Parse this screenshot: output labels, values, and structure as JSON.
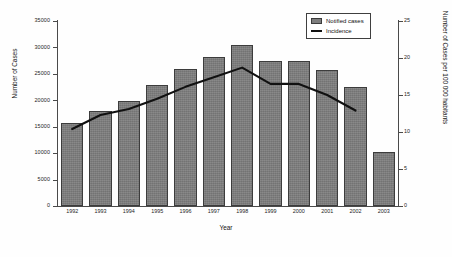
{
  "chart_data": {
    "type": "bar",
    "title": "",
    "xlabel": "Year",
    "ylabel": "Number of Cases",
    "y2label": "Number of Cases per 100 000 habitants",
    "categories": [
      "1992",
      "1993",
      "1994",
      "1995",
      "1996",
      "1997",
      "1998",
      "1999",
      "2000",
      "2001",
      "2002",
      "2003"
    ],
    "ylim": [
      0,
      35000
    ],
    "y2lim": [
      0,
      25
    ],
    "yticks": [
      "0",
      "5000",
      "10000",
      "15000",
      "20000",
      "25000",
      "30000",
      "35000"
    ],
    "y2ticks": [
      "0",
      "5",
      "10",
      "15",
      "20",
      "25"
    ],
    "grid": false,
    "legend_position": "top-right",
    "series": [
      {
        "name": "Notified cases",
        "type": "bar",
        "axis": "left",
        "color": "#7e7e7e",
        "values": [
          15700,
          17900,
          19800,
          22900,
          26000,
          28200,
          30500,
          27400,
          27500,
          25800,
          22600,
          10200
        ]
      },
      {
        "name": "Incidence",
        "type": "line",
        "axis": "right",
        "color": "#111111",
        "x": [
          "1992",
          "1993",
          "1994",
          "1995",
          "1996",
          "1997",
          "1998",
          "1999",
          "2000",
          "2001",
          "2002"
        ],
        "values": [
          10.4,
          12.3,
          13.1,
          14.5,
          16.1,
          17.4,
          18.7,
          16.5,
          16.5,
          15.0,
          12.9
        ]
      }
    ]
  },
  "legend": {
    "items": [
      {
        "label": "Notified cases",
        "marker": "box"
      },
      {
        "label": "Incidence",
        "marker": "line"
      }
    ]
  }
}
